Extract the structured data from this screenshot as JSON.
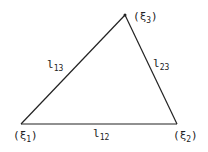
{
  "diagram": {
    "type": "triangle",
    "vertices": [
      {
        "id": "xi1",
        "symbol": "ξ",
        "subscript": "1",
        "x": 21,
        "y": 124
      },
      {
        "id": "xi2",
        "symbol": "ξ",
        "subscript": "2",
        "x": 177,
        "y": 124
      },
      {
        "id": "xi3",
        "symbol": "ξ",
        "subscript": "3",
        "x": 125,
        "y": 15
      }
    ],
    "edges": [
      {
        "id": "l12",
        "from": "xi1",
        "to": "xi2",
        "label": "l",
        "subscript": "12"
      },
      {
        "id": "l13",
        "from": "xi1",
        "to": "xi3",
        "label": "l",
        "subscript": "13"
      },
      {
        "id": "l23",
        "from": "xi2",
        "to": "xi3",
        "label": "l",
        "subscript": "23"
      }
    ],
    "stroke_color": "#222222"
  }
}
